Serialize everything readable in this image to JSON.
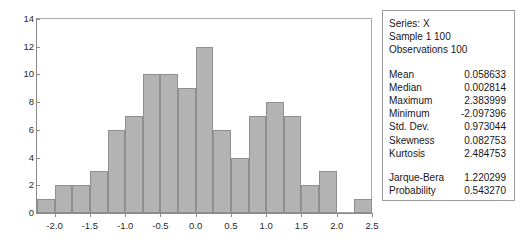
{
  "chart_data": {
    "type": "bar",
    "title": "",
    "xlabel": "",
    "ylabel": "",
    "xlim": [
      -2.25,
      2.5
    ],
    "ylim": [
      0,
      14
    ],
    "grid": false,
    "legend": null,
    "bin_width": 0.25,
    "categories": [
      "-2.25",
      "-2.00",
      "-1.75",
      "-1.50",
      "-1.25",
      "-1.00",
      "-0.75",
      "-0.50",
      "-0.25",
      "0.00",
      "0.25",
      "0.50",
      "0.75",
      "1.00",
      "1.25",
      "1.50",
      "1.75",
      "2.00",
      "2.25"
    ],
    "values": [
      1,
      2,
      2,
      3,
      6,
      7,
      10,
      10,
      9,
      12,
      6,
      4,
      7,
      8,
      7,
      2,
      3,
      0,
      1
    ],
    "y_ticks": [
      "0",
      "2",
      "4",
      "6",
      "8",
      "10",
      "12",
      "14"
    ],
    "y_tick_values": [
      0,
      2,
      4,
      6,
      8,
      10,
      12,
      14
    ],
    "x_ticks": [
      "-2.0",
      "-1.5",
      "-1.0",
      "-0.5",
      "0.0",
      "0.5",
      "1.0",
      "1.5",
      "2.0",
      "2.5"
    ],
    "x_tick_values": [
      -2.0,
      -1.5,
      -1.0,
      -0.5,
      0.0,
      0.5,
      1.0,
      1.5,
      2.0,
      2.5
    ],
    "bar_color": "#b3b3b3",
    "bar_border_color": "#8f8f8f",
    "axis_color": "#8a8a8a"
  },
  "stats": {
    "header": [
      "Series: X",
      "Sample 1 100",
      "Observations 100"
    ],
    "rows": [
      {
        "label": "Mean",
        "value": "0.058633"
      },
      {
        "label": "Median",
        "value": "0.002814"
      },
      {
        "label": "Maximum",
        "value": "2.383999"
      },
      {
        "label": "Minimum",
        "value": "-2.097396"
      },
      {
        "label": "Std. Dev.",
        "value": "0.973044"
      },
      {
        "label": "Skewness",
        "value": "0.082753"
      },
      {
        "label": "Kurtosis",
        "value": "2.484753"
      }
    ],
    "test_rows": [
      {
        "label": "Jarque-Bera",
        "value": "1.220299"
      },
      {
        "label": "Probability",
        "value": "0.543270"
      }
    ]
  }
}
